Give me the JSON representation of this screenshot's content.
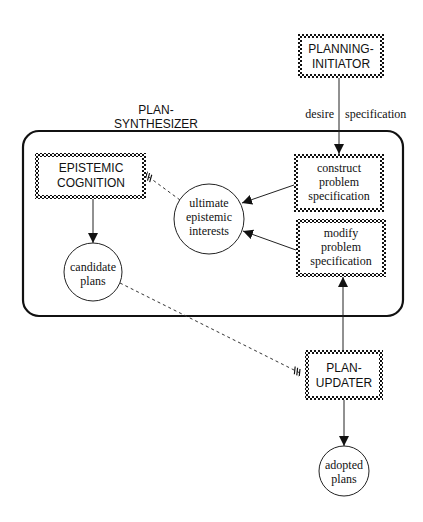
{
  "diagram": {
    "container": {
      "label_line1": "PLAN-",
      "label_line2": "SYNTHESIZER"
    },
    "modules": {
      "planning_initiator": {
        "line1": "PLANNING-",
        "line2": "INITIATOR"
      },
      "epistemic_cognition": {
        "line1": "EPISTEMIC",
        "line2": "COGNITION"
      },
      "plan_updater": {
        "line1": "PLAN-",
        "line2": "UPDATER"
      }
    },
    "processes": {
      "construct": {
        "line1": "construct",
        "line2": "problem",
        "line3": "specification"
      },
      "modify": {
        "line1": "modify",
        "line2": "problem",
        "line3": "specification"
      }
    },
    "data_nodes": {
      "ultimate_interests": {
        "line1": "ultimate",
        "line2": "epistemic",
        "line3": "interests"
      },
      "candidate_plans": {
        "line1": "candidate",
        "line2": "plans"
      },
      "adopted_plans": {
        "line1": "adopted",
        "line2": "plans"
      }
    },
    "edge_labels": {
      "desire_left": "desire",
      "desire_right": "specification"
    }
  }
}
